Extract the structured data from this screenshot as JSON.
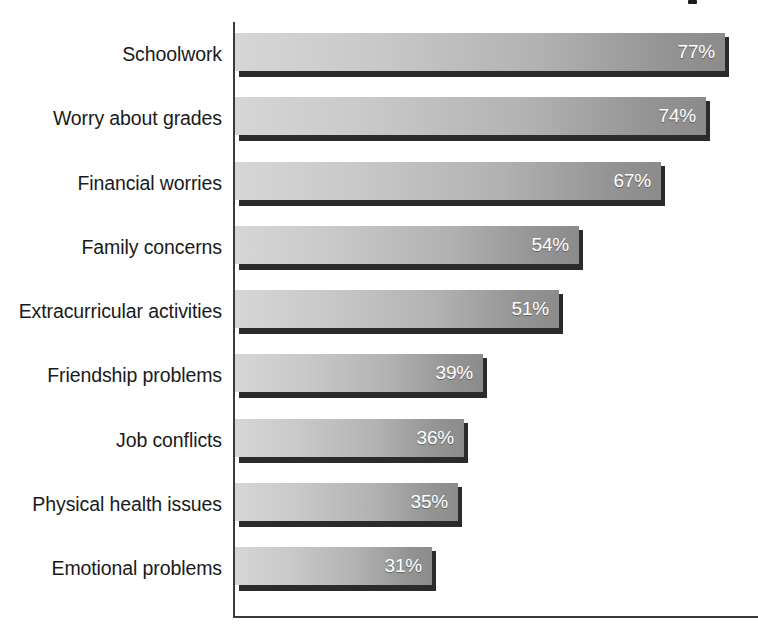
{
  "chart_data": {
    "type": "bar",
    "orientation": "horizontal",
    "title": "",
    "subtitle": "",
    "xlabel": "",
    "ylabel": "",
    "xlim": [
      0,
      80
    ],
    "grid": false,
    "legend": false,
    "value_suffix": "%",
    "categories": [
      "Schoolwork",
      "Worry about grades",
      "Financial worries",
      "Family concerns",
      "Extracurricular activities",
      "Friendship problems",
      "Job conflicts",
      "Physical health issues",
      "Emotional problems"
    ],
    "values": [
      77,
      74,
      67,
      54,
      51,
      39,
      36,
      35,
      31
    ],
    "value_labels": [
      "77%",
      "74%",
      "67%",
      "54%",
      "51%",
      "39%",
      "36%",
      "35%",
      "31%"
    ],
    "bars": [
      {
        "category": "Schoolwork",
        "value": 77,
        "label": "77%"
      },
      {
        "category": "Worry about grades",
        "value": 74,
        "label": "74%"
      },
      {
        "category": "Financial worries",
        "value": 67,
        "label": "67%"
      },
      {
        "category": "Family concerns",
        "value": 54,
        "label": "54%"
      },
      {
        "category": "Extracurricular activities",
        "value": 51,
        "label": "51%"
      },
      {
        "category": "Friendship problems",
        "value": 39,
        "label": "39%"
      },
      {
        "category": "Job conflicts",
        "value": 36,
        "label": "36%"
      },
      {
        "category": "Physical health issues",
        "value": 35,
        "label": "35%"
      },
      {
        "category": "Emotional problems",
        "value": 31,
        "label": "31%"
      }
    ],
    "colors": {
      "bar_gradient_start": "#d6d6d6",
      "bar_gradient_end": "#8b8b8b",
      "bar_shadow": "#2b2b2b",
      "value_text": "#ffffff",
      "category_text": "#1a1a1a",
      "axis": "#3a3a3a",
      "background": "#ffffff"
    }
  }
}
